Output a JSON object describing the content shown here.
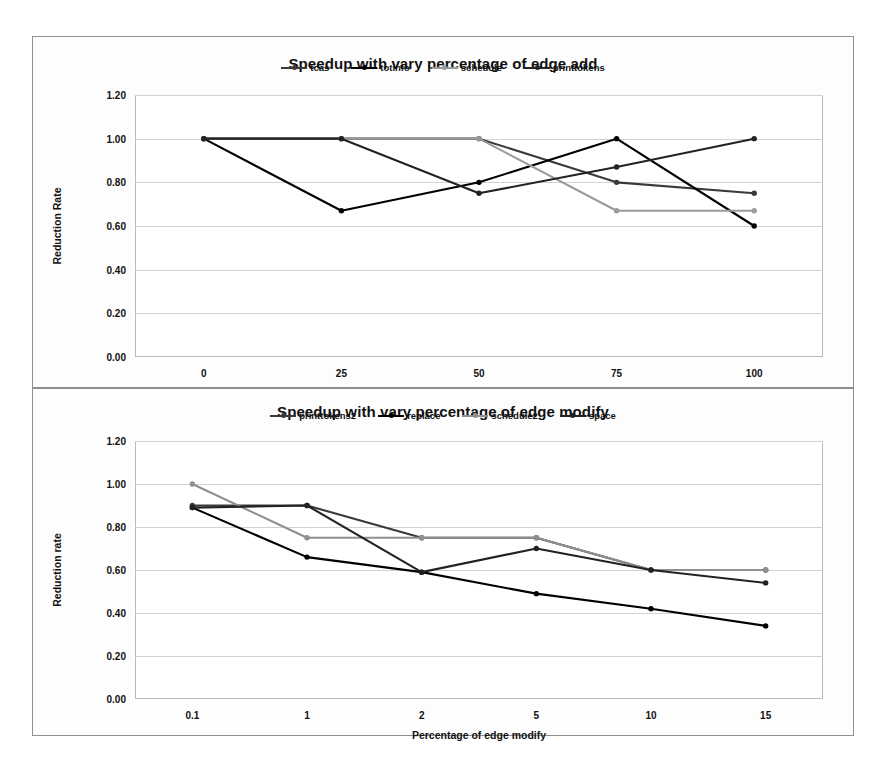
{
  "chart_data": [
    {
      "type": "line",
      "title": "Speedup with vary percentage of edge add",
      "xlabel": "Percentage of edge add",
      "ylabel": "Reduction Rate",
      "categories": [
        "0",
        "25",
        "50",
        "75",
        "100"
      ],
      "yticks": [
        "0.00",
        "0.20",
        "0.40",
        "0.60",
        "0.80",
        "1.00",
        "1.20"
      ],
      "ylim": [
        0,
        1.2
      ],
      "grid": true,
      "legend_position": "top-center",
      "series": [
        {
          "name": "tcas",
          "color": "#3a3a3a",
          "values": [
            1.0,
            1.0,
            1.0,
            0.8,
            0.75
          ]
        },
        {
          "name": "totinfo",
          "color": "#000000",
          "values": [
            1.0,
            0.67,
            0.8,
            1.0,
            0.6
          ]
        },
        {
          "name": "schedule",
          "color": "#9a9a9a",
          "values": [
            1.0,
            1.0,
            1.0,
            0.67,
            0.67
          ]
        },
        {
          "name": "printtokens",
          "color": "#222222",
          "values": [
            1.0,
            1.0,
            0.75,
            0.87,
            1.0
          ]
        }
      ]
    },
    {
      "type": "line",
      "title": "Speedup with vary percentage of edge modify",
      "xlabel": "Percentage of edge modify",
      "ylabel": "Reduction rate",
      "categories": [
        "0.1",
        "1",
        "2",
        "5",
        "10",
        "15"
      ],
      "yticks": [
        "0.00",
        "0.20",
        "0.40",
        "0.60",
        "0.80",
        "1.00",
        "1.20"
      ],
      "ylim": [
        0,
        1.2
      ],
      "grid": true,
      "legend_position": "top-center",
      "series": [
        {
          "name": "printtokens2",
          "color": "#3a3a3a",
          "values": [
            0.9,
            0.9,
            0.75,
            0.75,
            0.6,
            0.6
          ]
        },
        {
          "name": "replace",
          "color": "#000000",
          "values": [
            0.89,
            0.66,
            0.59,
            0.49,
            0.42,
            0.34
          ]
        },
        {
          "name": "schedule2",
          "color": "#8f8f8f",
          "values": [
            1.0,
            0.75,
            0.75,
            0.75,
            0.6,
            0.6
          ]
        },
        {
          "name": "space",
          "color": "#222222",
          "values": [
            0.89,
            0.9,
            0.59,
            0.7,
            0.6,
            0.54
          ]
        }
      ]
    }
  ]
}
